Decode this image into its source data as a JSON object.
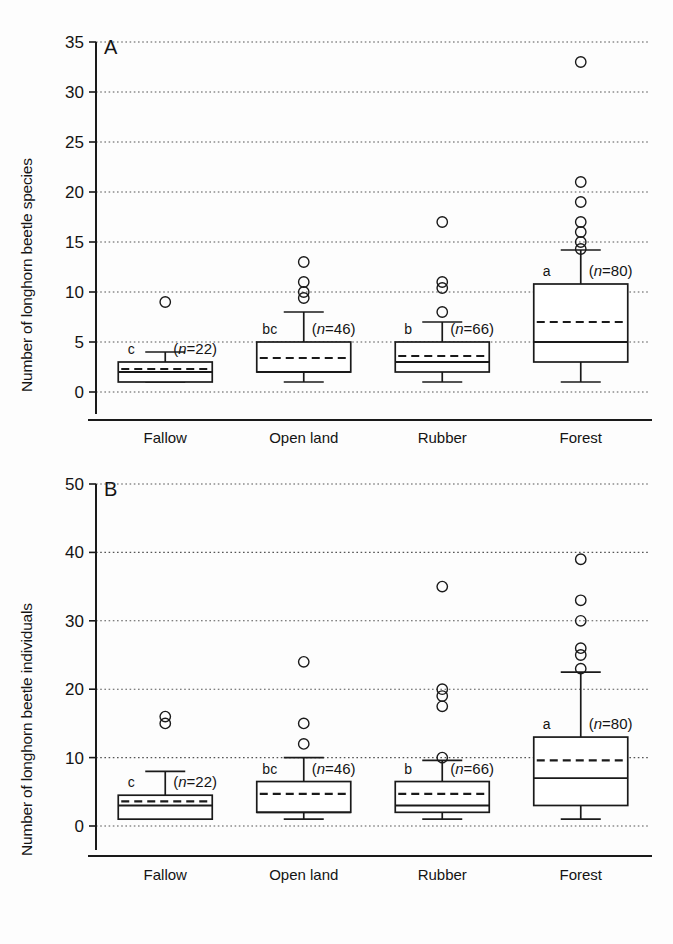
{
  "figure": {
    "background": "#fdfdfd",
    "ink": "#1a1a1a",
    "categories": [
      "Fallow",
      "Open land",
      "Rubber",
      "Forest"
    ]
  },
  "panels": {
    "A": {
      "letter": "A",
      "ylabel": "Number of longhorn beetle species",
      "ticks": [
        "0",
        "5",
        "10",
        "15",
        "20",
        "25",
        "30",
        "35"
      ]
    },
    "B": {
      "letter": "B",
      "ylabel": "Number of longhorn beetle individuals",
      "ticks": [
        "0",
        "10",
        "20",
        "30",
        "40",
        "50"
      ]
    }
  },
  "chart_data": [
    {
      "type": "box",
      "panel": "A",
      "title": "A",
      "xlabel": "",
      "ylabel": "Number of longhorn beetle species",
      "ylim": [
        0,
        35
      ],
      "yticks": [
        0,
        5,
        10,
        15,
        20,
        25,
        30,
        35
      ],
      "grid": true,
      "categories": [
        "Fallow",
        "Open land",
        "Rubber",
        "Forest"
      ],
      "boxes": [
        {
          "category": "Fallow",
          "group_letter": "c",
          "n_label": "(n=22)",
          "n": 22,
          "whisker_low": 1,
          "q1": 1,
          "median": 2,
          "mean": 2.3,
          "q3": 3,
          "whisker_high": 4,
          "outliers": [
            9
          ]
        },
        {
          "category": "Open land",
          "group_letter": "bc",
          "n_label": "(n=46)",
          "n": 46,
          "whisker_low": 1,
          "q1": 2,
          "median": 2,
          "mean": 3.4,
          "q3": 5,
          "whisker_high": 8,
          "outliers": [
            13,
            11,
            10,
            9.4
          ]
        },
        {
          "category": "Rubber",
          "group_letter": "b",
          "n_label": "(n=66)",
          "n": 66,
          "whisker_low": 1,
          "q1": 2,
          "median": 3,
          "mean": 3.6,
          "q3": 5,
          "whisker_high": 7,
          "outliers": [
            17,
            11,
            10.4,
            8
          ]
        },
        {
          "category": "Forest",
          "group_letter": "a",
          "n_label": "(n=80)",
          "n": 80,
          "whisker_low": 1,
          "q1": 3,
          "median": 5,
          "mean": 7,
          "q3": 10.8,
          "whisker_high": 14.2,
          "outliers": [
            33,
            21,
            19,
            17,
            16,
            15,
            14.3
          ]
        }
      ]
    },
    {
      "type": "box",
      "panel": "B",
      "title": "B",
      "xlabel": "",
      "ylabel": "Number of longhorn beetle individuals",
      "ylim": [
        0,
        50
      ],
      "yticks": [
        0,
        10,
        20,
        30,
        40,
        50
      ],
      "grid": true,
      "categories": [
        "Fallow",
        "Open land",
        "Rubber",
        "Forest"
      ],
      "boxes": [
        {
          "category": "Fallow",
          "group_letter": "c",
          "n_label": "(n=22)",
          "n": 22,
          "whisker_low": 1,
          "q1": 1,
          "median": 3,
          "mean": 3.6,
          "q3": 4.5,
          "whisker_high": 8,
          "outliers": [
            16,
            15
          ]
        },
        {
          "category": "Open land",
          "group_letter": "bc",
          "n_label": "(n=46)",
          "n": 46,
          "whisker_low": 1,
          "q1": 2,
          "median": 2,
          "mean": 4.7,
          "q3": 6.5,
          "whisker_high": 10,
          "outliers": [
            24,
            15,
            12
          ]
        },
        {
          "category": "Rubber",
          "group_letter": "b",
          "n_label": "(n=66)",
          "n": 66,
          "whisker_low": 1,
          "q1": 2,
          "median": 3,
          "mean": 4.7,
          "q3": 6.5,
          "whisker_high": 9.6,
          "outliers": [
            35,
            20,
            19,
            17.5,
            10
          ]
        },
        {
          "category": "Forest",
          "group_letter": "a",
          "n_label": "(n=80)",
          "n": 80,
          "whisker_low": 1,
          "q1": 3,
          "median": 7,
          "mean": 9.6,
          "q3": 13,
          "whisker_high": 22.5,
          "outliers": [
            39,
            33,
            30,
            26,
            25,
            23
          ]
        }
      ]
    }
  ]
}
